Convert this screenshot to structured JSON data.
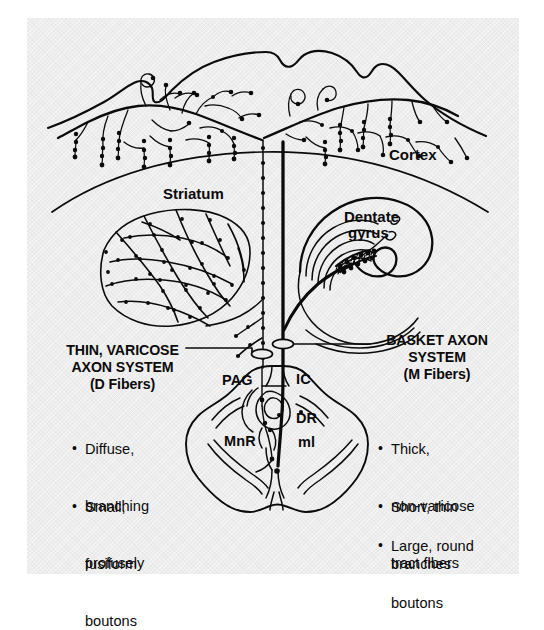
{
  "figure": {
    "background_color": "#ededed",
    "ink_color": "#0b0b0b"
  },
  "structure_labels": {
    "cortex": "Cortex",
    "striatum": "Striatum",
    "dentate_gyrus_line1": "Dentate",
    "dentate_gyrus_line2": "gyrus"
  },
  "brainstem_labels": {
    "pag": "PAG",
    "ic": "IC",
    "dr": "DR",
    "mnr": "MnR",
    "ml": "ml"
  },
  "left_panel": {
    "heading_line1": "THIN, VARICOSE",
    "heading_line2": "AXON SYSTEM",
    "heading_line3": "(D Fibers)",
    "bullets": [
      {
        "lines": [
          "Diffuse,",
          "branching",
          "profusely"
        ]
      },
      {
        "lines": [
          "Small,",
          "fusiform",
          "boutons"
        ]
      }
    ]
  },
  "right_panel": {
    "heading_line1": "BASKET AXON",
    "heading_line2": "SYSTEM",
    "heading_line3": "(M Fibers)",
    "bullets": [
      {
        "lines": [
          "Thick,",
          "non-varicose",
          "tract fibers"
        ]
      },
      {
        "lines": [
          "Short, thin",
          "branches"
        ]
      },
      {
        "lines": [
          "Large, round",
          "boutons"
        ]
      }
    ]
  }
}
